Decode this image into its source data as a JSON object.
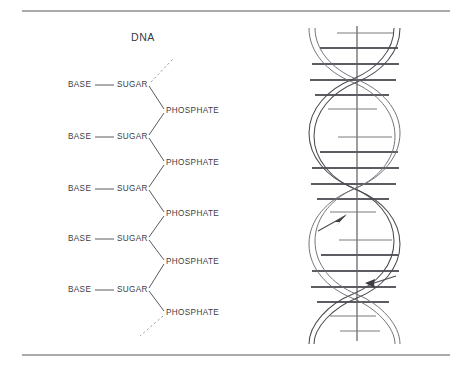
{
  "figure": {
    "title": "DNA",
    "title_x": 131,
    "title_y": 32,
    "width": 472,
    "height": 370,
    "background": "#ffffff",
    "ink_color": "#3d3d43",
    "rule_color": "#55555a"
  },
  "rules": [
    {
      "name": "top-rule",
      "x1": 22,
      "y1": 11,
      "x2": 450,
      "y2": 11
    },
    {
      "name": "bottom-rule",
      "x1": 22,
      "y1": 355,
      "x2": 450,
      "y2": 355
    }
  ],
  "backbone": {
    "base_label": "BASE",
    "sugar_label": "SUGAR",
    "phosphate_label": "PHOSPHATE",
    "units": [
      {
        "index": 1,
        "base_x": 68,
        "sugar_x": 117,
        "y": 81,
        "phosphate_x": 166,
        "phosphate_y": 107
      },
      {
        "index": 2,
        "base_x": 68,
        "sugar_x": 117,
        "y": 133,
        "phosphate_x": 166,
        "phosphate_y": 159
      },
      {
        "index": 3,
        "base_x": 68,
        "sugar_x": 117,
        "y": 185,
        "phosphate_x": 166,
        "phosphate_y": 210
      },
      {
        "index": 4,
        "base_x": 68,
        "sugar_x": 117,
        "y": 235,
        "phosphate_x": 166,
        "phosphate_y": 258
      },
      {
        "index": 5,
        "base_x": 68,
        "sugar_x": 117,
        "y": 286,
        "phosphate_x": 166,
        "phosphate_y": 309
      }
    ],
    "base_sugar_connector": {
      "x1": 94,
      "x2": 113,
      "style": "solid"
    },
    "lead_in": {
      "x1": 150,
      "y1": 82,
      "x2": 172,
      "y2": 60,
      "style": "dashed"
    },
    "lead_out": {
      "x1": 163,
      "y1": 316,
      "x2": 141,
      "y2": 335,
      "style": "dashed"
    }
  },
  "helix": {
    "name": "dna-double-helix",
    "left": 305,
    "right": 403,
    "top": 26,
    "bottom": 341,
    "axis_x": 357,
    "turns": 3,
    "rung_count": 18,
    "arrows": [
      {
        "name": "strand-direction-arrow-up",
        "x": 341,
        "y": 219,
        "direction": "up-right"
      },
      {
        "name": "strand-direction-arrow-down",
        "x": 373,
        "y": 283,
        "direction": "left"
      }
    ]
  }
}
